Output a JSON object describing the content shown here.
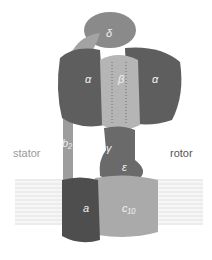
{
  "figure": {
    "side_labels": {
      "left": "stator",
      "right": "rotor"
    },
    "subunits": [
      {
        "id": "delta",
        "label": "δ"
      },
      {
        "id": "alpha_left",
        "label": "α"
      },
      {
        "id": "beta",
        "label": "β"
      },
      {
        "id": "alpha_right",
        "label": "α"
      },
      {
        "id": "b2",
        "label": "b₂"
      },
      {
        "id": "gamma",
        "label": "γ"
      },
      {
        "id": "epsilon",
        "label": "ε"
      },
      {
        "id": "a",
        "label": "a"
      },
      {
        "id": "c",
        "label": "c₁₀"
      }
    ],
    "colors": {
      "background": "#ffffff",
      "membrane": "#ececec",
      "alpha": "#5e5e5e",
      "beta": "#b5b5b5",
      "delta": "#8a8a8a",
      "b2": "#9d9d9d",
      "gamma_epsilon": "#6a6a6a",
      "a": "#4e4e4e",
      "c": "#aaaaaa",
      "label_text": "#f2f2f2",
      "stator_text": "#9a9a9a",
      "rotor_text": "#555555"
    }
  }
}
